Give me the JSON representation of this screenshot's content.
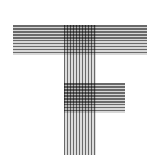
{
  "logo": {
    "description": "Letter T/F monogram formed by overlapping horizontal and vertical line stripes",
    "colors": {
      "line": "#6a6a6a",
      "gap": "#d8d8d8",
      "background": "#ffffff"
    },
    "parts": [
      "top-horizontal-bar",
      "vertical-stem",
      "middle-horizontal-bar"
    ]
  }
}
